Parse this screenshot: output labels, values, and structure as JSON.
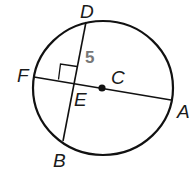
{
  "diagram": {
    "type": "circle-geometry",
    "points": {
      "D": "D",
      "F": "F",
      "C": "C",
      "E": "E",
      "A": "A",
      "B": "B"
    },
    "measure": "5",
    "colors": {
      "stroke": "#111111",
      "measure": "#777777"
    }
  }
}
